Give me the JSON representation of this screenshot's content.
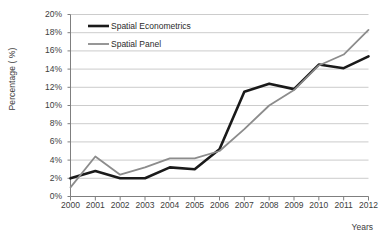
{
  "chart_data": {
    "type": "line",
    "title": "",
    "xlabel": "Years",
    "ylabel": "Percentage ( %)",
    "categories": [
      "2000",
      "2001",
      "2002",
      "2003",
      "2004",
      "2005",
      "2006",
      "2007",
      "2008",
      "2009",
      "2010",
      "2011",
      "2012"
    ],
    "x": [
      2000,
      2001,
      2002,
      2003,
      2004,
      2005,
      2006,
      2007,
      2008,
      2009,
      2010,
      2011,
      2012
    ],
    "series": [
      {
        "name": "Spatial Econometrics",
        "color": "#1a1a1a",
        "values": [
          2.0,
          2.8,
          2.0,
          2.0,
          3.2,
          3.0,
          5.2,
          11.5,
          12.4,
          11.8,
          14.5,
          14.1,
          15.4
        ]
      },
      {
        "name": "Spatial Panel",
        "color": "#8c8c8c",
        "values": [
          1.0,
          4.4,
          2.4,
          3.2,
          4.2,
          4.2,
          5.0,
          7.4,
          10.0,
          11.7,
          14.4,
          15.6,
          18.3
        ]
      }
    ],
    "ylim": [
      0,
      20
    ],
    "ytick_step": 2,
    "yticks": [
      "0%",
      "2%",
      "4%",
      "6%",
      "8%",
      "10%",
      "12%",
      "14%",
      "16%",
      "18%",
      "20%"
    ],
    "ytick_values": [
      0,
      2,
      4,
      6,
      8,
      10,
      12,
      14,
      16,
      18,
      20
    ],
    "xlim": [
      2000,
      2012
    ],
    "grid": "horizontal",
    "legend_position": "top-left"
  },
  "legend": {
    "items": [
      {
        "label": "Spatial Econometrics",
        "color": "#1a1a1a",
        "width": 2.6
      },
      {
        "label": "Spatial Panel",
        "color": "#8c8c8c",
        "width": 1.8
      }
    ]
  },
  "axes": {
    "y_title": "Percentage ( %)",
    "x_title": "Years"
  },
  "colors": {
    "axis": "#7f7f7f",
    "grid": "#bfbfbf",
    "text": "#3d3d3d",
    "background": "#ffffff"
  }
}
